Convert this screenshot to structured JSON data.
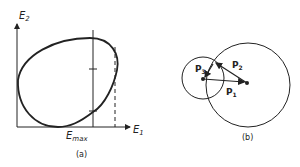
{
  "figure": {
    "panel_a": {
      "caption": "(a)",
      "y_axis_label": "E",
      "y_axis_sub": "2",
      "x_axis_label": "E",
      "x_axis_sub": "1",
      "marker_label": "E",
      "marker_sub": "max"
    },
    "panel_b": {
      "caption": "(b)",
      "vectors": [
        {
          "label": "P",
          "sub": "1"
        },
        {
          "label": "P",
          "sub": "2"
        },
        {
          "label": "P",
          "sub": "3"
        }
      ]
    },
    "colors": {
      "ink": "#222222",
      "background": "#ffffff"
    }
  }
}
